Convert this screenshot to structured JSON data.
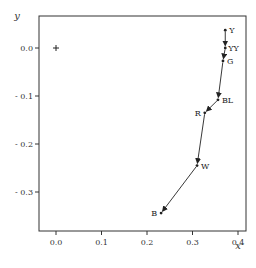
{
  "chart_data": {
    "type": "scatter",
    "title": "",
    "xlabel": "x",
    "ylabel": "y",
    "xlim": [
      -0.04,
      0.41
    ],
    "ylim": [
      -0.38,
      0.07
    ],
    "grid": false,
    "legend": null,
    "x_ticks": [
      0.0,
      0.1,
      0.2,
      0.3,
      0.4
    ],
    "x_tick_labels": [
      "0.0",
      "0.1",
      "0.2",
      "0.3",
      "0.4"
    ],
    "y_ticks": [
      0.0,
      -0.1,
      -0.2,
      -0.3
    ],
    "y_tick_labels": [
      "0.0",
      "- 0.1",
      "- 0.2",
      "- 0.3"
    ],
    "reference_point": {
      "marker": "+",
      "x": 0.0,
      "y": 0.0
    },
    "series": [
      {
        "name": "path",
        "connected_with_arrows": true,
        "points": [
          {
            "label": "Y",
            "x": 0.372,
            "y": 0.037
          },
          {
            "label": "YY",
            "x": 0.372,
            "y": 0.0
          },
          {
            "label": "G",
            "x": 0.367,
            "y": -0.027
          },
          {
            "label": "BL",
            "x": 0.356,
            "y": -0.108
          },
          {
            "label": "R",
            "x": 0.327,
            "y": -0.135
          },
          {
            "label": "W",
            "x": 0.31,
            "y": -0.245
          },
          {
            "label": "B",
            "x": 0.231,
            "y": -0.344
          }
        ]
      }
    ]
  }
}
